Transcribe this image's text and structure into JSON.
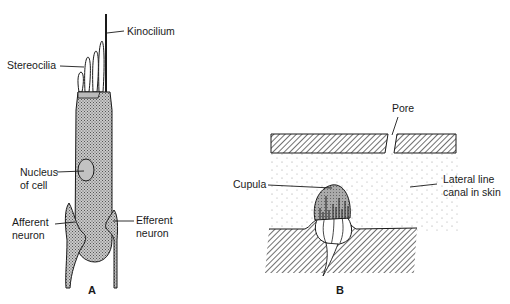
{
  "figure": {
    "panels": [
      {
        "id": "A",
        "label": "A",
        "subject": "hair cell",
        "labels": {
          "kinocilium": "Kinocilium",
          "stereocilia": "Stereocilia",
          "nucleus_line1": "Nucleus",
          "nucleus_line2": "of cell",
          "afferent_line1": "Afferent",
          "afferent_line2": "neuron",
          "efferent_line1": "Efferent",
          "efferent_line2": "neuron"
        }
      },
      {
        "id": "B",
        "label": "B",
        "subject": "neuromast in lateral line canal",
        "labels": {
          "pore": "Pore",
          "cupula": "Cupula",
          "canal_line1": "Lateral line",
          "canal_line2": "canal in skin"
        }
      }
    ],
    "colors": {
      "ink": "#1a1a1a",
      "fill_gray": "#b8b8b8",
      "hatch": "#333333",
      "background": "#ffffff"
    }
  }
}
